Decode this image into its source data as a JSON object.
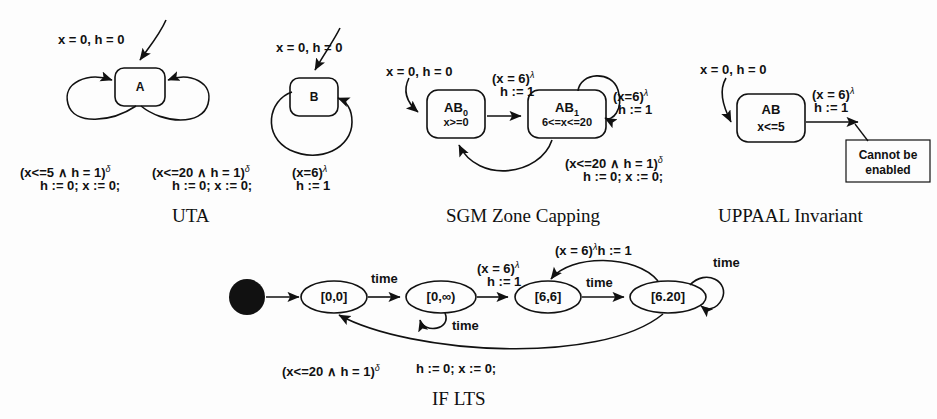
{
  "figure": {
    "stroke_color": "#111111",
    "background": "#fdfdfd"
  },
  "panels": [
    {
      "id": "uta",
      "caption": "UTA",
      "init_label": "x = 0, h = 0",
      "states": [
        {
          "name": "A",
          "invariant": ""
        }
      ],
      "transitions": [
        {
          "guard": "(x<=5 ∧ h = 1)",
          "guard_sup": "δ",
          "action": "h := 0; x := 0;"
        },
        {
          "guard": "(x<=20 ∧ h = 1)",
          "guard_sup": "δ",
          "action": "h := 0; x := 0;"
        }
      ]
    },
    {
      "id": "uta-b",
      "caption": "",
      "init_label": "x = 0, h = 0",
      "states": [
        {
          "name": "B",
          "invariant": ""
        }
      ],
      "transitions": [
        {
          "guard": "(x=6)",
          "guard_sup": "λ",
          "action": "h := 1"
        }
      ]
    },
    {
      "id": "sgm",
      "caption": "SGM Zone Capping",
      "init_label": "x = 0, h = 0",
      "states": [
        {
          "name": "AB",
          "name_sub": "0",
          "invariant": "x>=0"
        },
        {
          "name": "AB",
          "name_sub": "1",
          "invariant": "6<=x<=20"
        }
      ],
      "transitions": [
        {
          "guard": "(x = 6)",
          "guard_sup": "λ",
          "action": "h := 1"
        },
        {
          "guard": "(x=6)",
          "guard_sup": "λ",
          "action": "h := 1"
        },
        {
          "guard": "(x<=20 ∧ h = 1)",
          "guard_sup": "δ",
          "action": "h := 0; x := 0;"
        }
      ]
    },
    {
      "id": "uppaal",
      "caption": "UPPAAL Invariant",
      "init_label": "x = 0, h = 0",
      "states": [
        {
          "name": "AB",
          "invariant": "x<=5"
        }
      ],
      "transitions": [
        {
          "guard": "(x = 6)",
          "guard_sup": "λ",
          "action": "h := 1"
        }
      ],
      "note": {
        "line1": "Cannot be",
        "line2": "enabled"
      }
    },
    {
      "id": "iflts",
      "caption": "IF LTS",
      "states": [
        {
          "name": "[0,0]"
        },
        {
          "name": "[0,∞)"
        },
        {
          "name": "[6,6]"
        },
        {
          "name": "[6.20]"
        }
      ],
      "transitions": [
        {
          "label": "time"
        },
        {
          "label": "time"
        },
        {
          "label": "time"
        },
        {
          "label": "time"
        },
        {
          "guard": "(x = 6)",
          "guard_sup": "λ",
          "action": "h := 1"
        },
        {
          "guard": "(x = 6)",
          "guard_sup": "λ",
          "action": "h := 1",
          "inline": true
        },
        {
          "guard": "(x<=20 ∧ h = 1)",
          "guard_sup": "δ",
          "action": "h := 0; x := 0;"
        }
      ]
    }
  ],
  "labels": {
    "uta_init": "x = 0, h = 0",
    "uta_t1_guard": "(x<=5 ∧ h = 1)",
    "uta_t1_sup": "δ",
    "uta_t1_action": "h := 0; x := 0;",
    "uta_t2_guard": "(x<=20 ∧ h = 1)",
    "uta_t2_sup": "δ",
    "uta_t2_action": "h := 0; x := 0;",
    "uta_caption": "UTA",
    "b_init": "x = 0, h = 0",
    "b_guard": "(x=6)",
    "b_sup": "λ",
    "b_action": "h := 1",
    "sgm_init": "x = 0, h = 0",
    "sgm_t1_guard": "(x = 6)",
    "sgm_t1_sup": "λ",
    "sgm_t1_action": "h := 1",
    "sgm_t2_guard": "(x=6)",
    "sgm_t2_sup": "λ",
    "sgm_t2_action": "h := 1",
    "sgm_t3_guard": "(x<=20 ∧ h = 1)",
    "sgm_t3_sup": "δ",
    "sgm_t3_action": "h := 0; x := 0;",
    "sgm_caption": "SGM Zone Capping",
    "upp_init": "x = 0, h = 0",
    "upp_guard": "(x = 6)",
    "upp_sup": "λ",
    "upp_action": "h := 1",
    "upp_note1": "Cannot be",
    "upp_note2": "enabled",
    "upp_caption": "UPPAAL Invariant",
    "lts_time1": "time",
    "lts_time2": "time",
    "lts_time3": "time",
    "lts_time4": "time",
    "lts_g1": "(x = 6)",
    "lts_g1_sup": "λ",
    "lts_g1_action": "h := 1",
    "lts_g2": "(x = 6)",
    "lts_g2_sup": "λ",
    "lts_g2_action": "h := 1",
    "lts_back_guard": "(x<=20 ∧ h = 1)",
    "lts_back_sup": "δ",
    "lts_back_action": "h := 0; x := 0;",
    "lts_caption": "IF LTS"
  },
  "nodes": {
    "A": "A",
    "B": "B",
    "AB0_name": "AB",
    "AB0_sub": "0",
    "AB0_inv": "x>=0",
    "AB1_name": "AB",
    "AB1_sub": "1",
    "AB1_inv": "6<=x<=20",
    "ABu_name": "AB",
    "ABu_inv": "x<=5",
    "lts_s0": "[0,0]",
    "lts_s1": "[0,∞)",
    "lts_s2": "[6,6]",
    "lts_s3": "[6.20]"
  }
}
